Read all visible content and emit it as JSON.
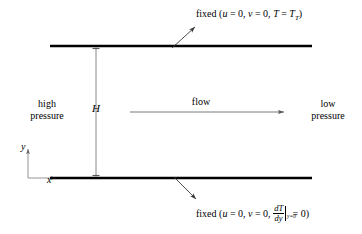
{
  "figure": {
    "background_color": "#ffffff",
    "line_color": "#000000",
    "plate_color": "#000000",
    "thin_line_color": "#808080",
    "width": 362,
    "height": 234
  },
  "labels": {
    "high_pressure_line1": "high",
    "high_pressure_line2": "pressure",
    "low_pressure_line1": "low",
    "low_pressure_line2": "pressure",
    "flow": "flow",
    "channel_height": "H",
    "axis_y": "y",
    "axis_x": "x"
  },
  "top_boundary_condition": {
    "prefix": "fixed (",
    "u_var": "u",
    "u_eq": " = 0,",
    "v_var": "v",
    "v_eq": " = 0,",
    "t_var": "T",
    "t_eq": " = ",
    "t_value_var": "T",
    "t_value_sub": "T",
    "suffix": ")",
    "plain_text": "fixed (u = 0, v = 0, T = T_T)"
  },
  "bottom_boundary_condition": {
    "prefix": "fixed (",
    "u_var": "u",
    "u_eq": " = 0,",
    "v_var": "v",
    "v_eq": " = 0,",
    "frac_numerator": "dT",
    "frac_denominator": "dy",
    "evaluated_at": "y=0",
    "equals_zero": " = 0)",
    "plain_text": "fixed (u = 0, v = 0, dT/dy|_{y=0} = 0)"
  },
  "geometry": {
    "top_plate": {
      "x1": 50,
      "y1": 46,
      "x2": 312,
      "y2": 46,
      "thickness": 2.6
    },
    "bottom_plate": {
      "x1": 50,
      "y1": 178,
      "x2": 312,
      "y2": 178,
      "thickness": 2.6
    },
    "height_dimension_line": {
      "x": 96,
      "y_top": 46,
      "y_bottom": 178
    },
    "flow_arrow": {
      "x1": 130,
      "y": 112,
      "x2": 285
    },
    "top_leader_arrow": {
      "x1": 172,
      "y1": 48,
      "x2": 196,
      "y2": 26
    },
    "bottom_leader_arrow": {
      "x1": 174,
      "y1": 177,
      "x2": 197,
      "y2": 200
    },
    "y_axis": {
      "x": 28,
      "y_bottom": 178,
      "y_top": 148
    },
    "x_axis": {
      "x1": 28,
      "y": 178,
      "x2": 58
    }
  }
}
